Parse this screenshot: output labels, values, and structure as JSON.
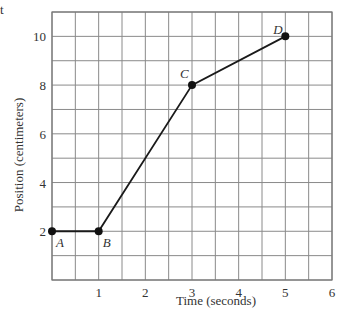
{
  "corner_fragment": "t",
  "chart_data": {
    "type": "line",
    "title": "",
    "xlabel": "Time (seconds)",
    "ylabel": "Position (centimeters)",
    "xlim": [
      0,
      6
    ],
    "ylim": [
      0,
      11
    ],
    "x_ticks": [
      1,
      2,
      3,
      4,
      5,
      6
    ],
    "y_ticks": [
      2,
      4,
      6,
      8,
      10
    ],
    "x_grid_step": 0.5,
    "y_grid_step": 1,
    "grid": true,
    "legend": null,
    "series": [
      {
        "name": "position",
        "points": [
          {
            "label": "A",
            "x": 0,
            "y": 2
          },
          {
            "label": "B",
            "x": 1,
            "y": 2
          },
          {
            "label": "C",
            "x": 3,
            "y": 8
          },
          {
            "label": "D",
            "x": 5,
            "y": 10
          }
        ]
      }
    ],
    "colors": {
      "grid": "#8a8a8a",
      "line": "#1a1a1a",
      "point": "#111111"
    }
  }
}
